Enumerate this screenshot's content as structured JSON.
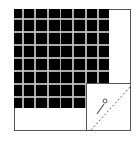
{
  "diagram": {
    "grid": {
      "rows": 8,
      "cols": 8,
      "background": "#000000",
      "line_color": "#c8c8c8"
    },
    "inset": {
      "icon": "pen-icon",
      "line": "dashed-diagonal"
    }
  }
}
